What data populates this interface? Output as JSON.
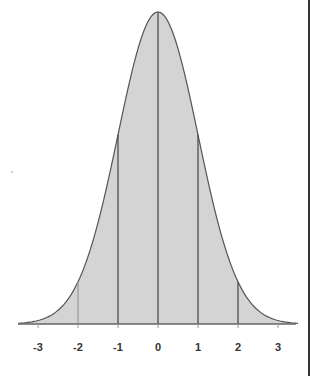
{
  "chart_data": {
    "type": "area",
    "title": "",
    "xlabel": "",
    "ylabel": "",
    "xlim": [
      -3.5,
      3.5
    ],
    "ylim": [
      0,
      0.4
    ],
    "x_ticks": [
      -3,
      -2,
      -1,
      0,
      1,
      2,
      3
    ],
    "x_tick_labels": [
      "-3",
      "-2",
      "-1",
      "0",
      "1",
      "2",
      "3"
    ],
    "vertical_lines_at": [
      -2,
      -1,
      0,
      1,
      2
    ],
    "series": [
      {
        "name": "Normal density",
        "x": [
          -3.5,
          -3,
          -2.5,
          -2,
          -1.5,
          -1,
          -0.5,
          0,
          0.5,
          1,
          1.5,
          2,
          2.5,
          3,
          3.5
        ],
        "values": [
          0.001,
          0.004,
          0.018,
          0.054,
          0.13,
          0.242,
          0.352,
          0.399,
          0.352,
          0.242,
          0.13,
          0.054,
          0.018,
          0.004,
          0.001
        ]
      }
    ],
    "fill_color": "#d4d4d4",
    "line_color": "#555555",
    "grid": false,
    "legend": null
  }
}
